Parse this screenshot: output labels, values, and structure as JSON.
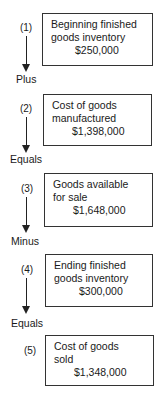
{
  "diagram": {
    "steps": [
      {
        "number": "(1)",
        "lines": [
          "Beginning finished",
          "goods inventory"
        ],
        "amount": "$250,000"
      },
      {
        "number": "(2)",
        "lines": [
          "Cost of goods",
          "manufactured"
        ],
        "amount": "$1,398,000"
      },
      {
        "number": "(3)",
        "lines": [
          "Goods available",
          "for sale"
        ],
        "amount": "$1,648,000"
      },
      {
        "number": "(4)",
        "lines": [
          "Ending finished",
          "goods inventory"
        ],
        "amount": "$300,000"
      },
      {
        "number": "(5)",
        "lines": [
          "Cost of goods",
          "sold"
        ],
        "amount": "$1,348,000"
      }
    ],
    "operators": [
      "Plus",
      "Equals",
      "Minus",
      "Equals"
    ],
    "colors": {
      "line": "#222222",
      "text": "#1a1a1a",
      "background": "#ffffff"
    }
  }
}
